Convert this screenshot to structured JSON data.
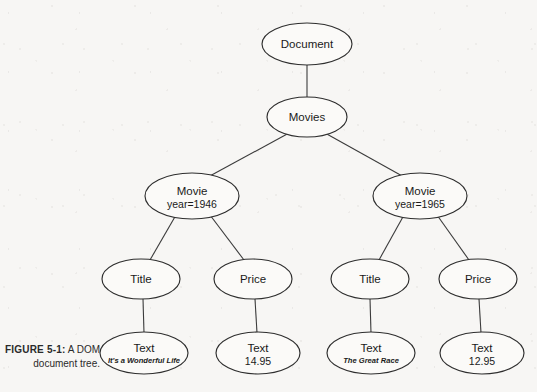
{
  "figure": {
    "label": "FIGURE 5-1:",
    "caption_line1": "A DOM",
    "caption_line2": "document tree."
  },
  "diagram": {
    "type": "tree",
    "title": "A DOM document tree",
    "node_shape": "ellipse",
    "edge_style": "straight-line",
    "colors": {
      "background": "#f7f6f4",
      "node_fill": "#fbfaf8",
      "node_stroke": "#2e2e2e",
      "edge_stroke": "#3b3b3b",
      "text": "#1a1a1a"
    },
    "nodes": [
      {
        "id": "document",
        "label": "Document",
        "sub": "",
        "sub_italic": false,
        "cx": 307,
        "cy": 44,
        "rx": 45,
        "ry": 21,
        "level": 0
      },
      {
        "id": "movies",
        "label": "Movies",
        "sub": "",
        "sub_italic": false,
        "cx": 307,
        "cy": 117,
        "rx": 40,
        "ry": 20,
        "level": 1
      },
      {
        "id": "movie-1946",
        "label": "Movie",
        "sub": "year=1946",
        "sub_italic": false,
        "cx": 192,
        "cy": 196,
        "rx": 47,
        "ry": 23,
        "level": 2
      },
      {
        "id": "movie-1965",
        "label": "Movie",
        "sub": "year=1965",
        "sub_italic": false,
        "cx": 420,
        "cy": 196,
        "rx": 47,
        "ry": 23,
        "level": 2
      },
      {
        "id": "title-1",
        "label": "Title",
        "sub": "",
        "sub_italic": false,
        "cx": 141,
        "cy": 279,
        "rx": 39,
        "ry": 20,
        "level": 3
      },
      {
        "id": "price-1",
        "label": "Price",
        "sub": "",
        "sub_italic": false,
        "cx": 253,
        "cy": 279,
        "rx": 39,
        "ry": 20,
        "level": 3
      },
      {
        "id": "title-2",
        "label": "Title",
        "sub": "",
        "sub_italic": false,
        "cx": 370,
        "cy": 279,
        "rx": 39,
        "ry": 20,
        "level": 3
      },
      {
        "id": "price-2",
        "label": "Price",
        "sub": "",
        "sub_italic": false,
        "cx": 478,
        "cy": 279,
        "rx": 39,
        "ry": 20,
        "level": 3
      },
      {
        "id": "text-title-1",
        "label": "Text",
        "sub": "It's a Wonderful Life",
        "sub_italic": true,
        "cx": 144,
        "cy": 353,
        "rx": 44,
        "ry": 21,
        "level": 4
      },
      {
        "id": "text-price-1",
        "label": "Text",
        "sub": "14.95",
        "sub_italic": false,
        "cx": 258,
        "cy": 353,
        "rx": 42,
        "ry": 21,
        "level": 4
      },
      {
        "id": "text-title-2",
        "label": "Text",
        "sub": "The Great Race",
        "sub_italic": true,
        "cx": 371,
        "cy": 353,
        "rx": 44,
        "ry": 21,
        "level": 4
      },
      {
        "id": "text-price-2",
        "label": "Text",
        "sub": "12.95",
        "sub_italic": false,
        "cx": 482,
        "cy": 353,
        "rx": 42,
        "ry": 21,
        "level": 4
      }
    ],
    "edges": [
      {
        "id": "edge-document-movies",
        "from": "document",
        "to": "movies",
        "x1": 307,
        "y1": 65,
        "x2": 307,
        "y2": 97
      },
      {
        "id": "edge-movies-movie1946",
        "from": "movies",
        "to": "movie-1946",
        "x1": 289,
        "y1": 133,
        "x2": 208,
        "y2": 177
      },
      {
        "id": "edge-movies-movie1965",
        "from": "movies",
        "to": "movie-1965",
        "x1": 325,
        "y1": 133,
        "x2": 404,
        "y2": 177
      },
      {
        "id": "edge-movie1946-title1",
        "from": "movie-1946",
        "to": "title-1",
        "x1": 176,
        "y1": 215,
        "x2": 150,
        "y2": 260
      },
      {
        "id": "edge-movie1946-price1",
        "from": "movie-1946",
        "to": "price-1",
        "x1": 210,
        "y1": 215,
        "x2": 244,
        "y2": 260
      },
      {
        "id": "edge-movie1965-title2",
        "from": "movie-1965",
        "to": "title-2",
        "x1": 404,
        "y1": 215,
        "x2": 379,
        "y2": 260
      },
      {
        "id": "edge-movie1965-price2",
        "from": "movie-1965",
        "to": "price-2",
        "x1": 437,
        "y1": 215,
        "x2": 469,
        "y2": 260
      },
      {
        "id": "edge-title1-text",
        "from": "title-1",
        "to": "text-title-1",
        "x1": 143,
        "y1": 299,
        "x2": 144,
        "y2": 333
      },
      {
        "id": "edge-price1-text",
        "from": "price-1",
        "to": "text-price-1",
        "x1": 255,
        "y1": 299,
        "x2": 257,
        "y2": 333
      },
      {
        "id": "edge-title2-text",
        "from": "title-2",
        "to": "text-title-2",
        "x1": 370,
        "y1": 299,
        "x2": 371,
        "y2": 333
      },
      {
        "id": "edge-price2-text",
        "from": "price-2",
        "to": "text-price-2",
        "x1": 479,
        "y1": 299,
        "x2": 481,
        "y2": 333
      }
    ]
  }
}
